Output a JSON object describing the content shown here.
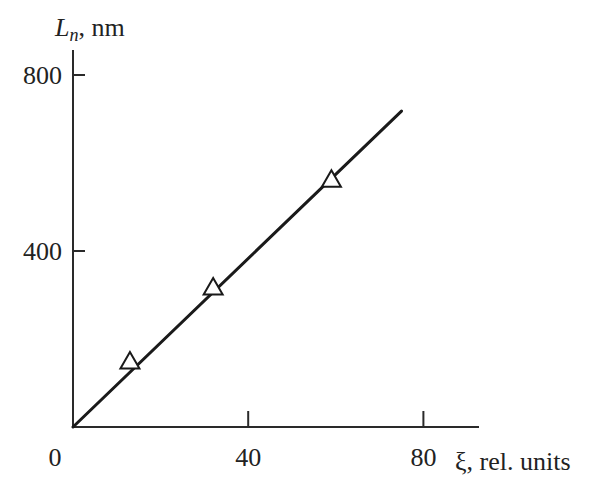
{
  "chart_data": {
    "type": "line",
    "title": "",
    "xlabel": "ξ, rel. units",
    "ylabel": "L_n, nm",
    "ylabel_parts": {
      "main": "L",
      "sub": "n",
      "rest": ", nm"
    },
    "xlim": [
      0,
      86
    ],
    "ylim": [
      0,
      860
    ],
    "x_ticks": [
      0,
      40,
      80
    ],
    "x_tick_labels": [
      "0",
      "40",
      "80"
    ],
    "y_ticks": [
      400,
      800
    ],
    "y_tick_labels": [
      "400",
      "800"
    ],
    "grid": false,
    "legend": null,
    "series": [
      {
        "name": "measured",
        "marker": "open-triangle",
        "x": [
          13,
          32,
          59
        ],
        "y": [
          148,
          316,
          561
        ]
      },
      {
        "name": "linear fit",
        "style": "solid-line",
        "x": [
          0,
          75
        ],
        "y": [
          0,
          718
        ]
      }
    ]
  },
  "colors": {
    "axis": "#2a2a2a",
    "line": "#1a1a1a",
    "marker_stroke": "#1a1a1a",
    "marker_fill": "#ffffff",
    "background": "#ffffff"
  }
}
